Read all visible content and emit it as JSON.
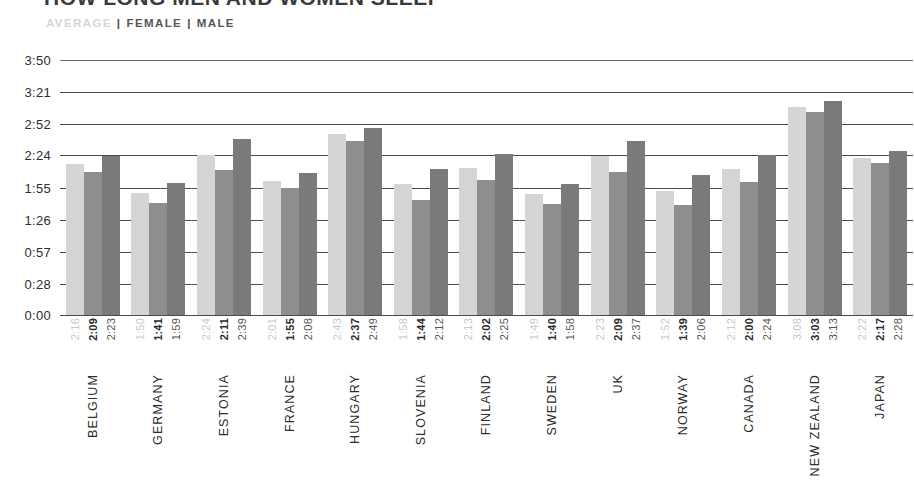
{
  "header": {
    "title": "HOW LONG MEN AND WOMEN SLEEP",
    "legend": {
      "average_label": "AVERAGE",
      "female_label": "FEMALE",
      "male_label": "MALE",
      "separator": "|"
    }
  },
  "colors": {
    "average": "#d5d5d5",
    "female": "#8e8e8e",
    "male": "#7a7a7a",
    "gridline": "#4a4a4a",
    "text": "#2b2b2b"
  },
  "chart_data": {
    "type": "bar",
    "title": "HOW LONG MEN AND WOMEN SLEEP",
    "xlabel": "",
    "ylabel": "",
    "grid": true,
    "legend_position": "top-left",
    "ytick_labels": [
      "3:50",
      "3:21",
      "2:52",
      "2:24",
      "1:55",
      "1:26",
      "0:57",
      "0:28",
      "0:00"
    ],
    "ytick_values": [
      230,
      201,
      172,
      144,
      115,
      86,
      57,
      28,
      0
    ],
    "ylim": [
      0,
      230
    ],
    "categories": [
      "BELGIUM",
      "GERMANY",
      "ESTONIA",
      "FRANCE",
      "HUNGARY",
      "SLOVENIA",
      "FINLAND",
      "SWEDEN",
      "UK",
      "NORWAY",
      "CANADA",
      "NEW ZEALAND",
      "JAPAN"
    ],
    "series": [
      {
        "name": "AVERAGE",
        "color": "#d5d5d5",
        "labels": [
          "2:16",
          "1:50",
          "2:24",
          "2:01",
          "2:43",
          "1:58",
          "2:13",
          "1:49",
          "2:23",
          "1:52",
          "2:12",
          "3:08",
          "2:22"
        ],
        "values": [
          136,
          110,
          144,
          121,
          163,
          118,
          133,
          109,
          143,
          112,
          132,
          188,
          142
        ]
      },
      {
        "name": "FEMALE",
        "color": "#8e8e8e",
        "labels": [
          "2:09",
          "1:41",
          "2:11",
          "1:55",
          "2:37",
          "1:44",
          "2:02",
          "1:40",
          "2:09",
          "1:39",
          "2:00",
          "3:03",
          "2:17"
        ],
        "values": [
          129,
          101,
          131,
          115,
          157,
          104,
          122,
          100,
          129,
          99,
          120,
          183,
          137
        ]
      },
      {
        "name": "MALE",
        "color": "#7a7a7a",
        "labels": [
          "2:23",
          "1:59",
          "2:39",
          "2:08",
          "2:49",
          "2:12",
          "2:25",
          "1:58",
          "2:37",
          "2:06",
          "2:24",
          "3:13",
          "2:28"
        ],
        "values": [
          143,
          119,
          159,
          128,
          169,
          132,
          145,
          118,
          157,
          126,
          144,
          193,
          148
        ]
      }
    ]
  }
}
